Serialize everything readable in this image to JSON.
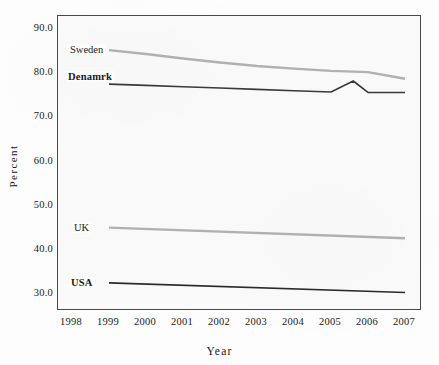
{
  "clipped_title": "",
  "chart_data": {
    "type": "line",
    "title": "",
    "xlabel": "Year",
    "ylabel": "Percent",
    "xlim": [
      1998,
      2007
    ],
    "ylim": [
      30.0,
      90.0
    ],
    "xticks": [
      "1998",
      "1999",
      "2000",
      "2001",
      "2002",
      "2003",
      "2004",
      "2005",
      "2006",
      "2007"
    ],
    "yticks": [
      "30.0",
      "40.0",
      "50.0",
      "60.0",
      "70.0",
      "80.0",
      "90.0"
    ],
    "grid": false,
    "legend": "inline-labels",
    "series": [
      {
        "name": "Sweden",
        "color": "#b0b0b0",
        "label_bold": false,
        "x": [
          1999,
          2000,
          2001,
          2002,
          2003,
          2004,
          2005,
          2006,
          2007
        ],
        "values": [
          85.0,
          84.1,
          83.1,
          82.2,
          81.4,
          80.8,
          80.3,
          80.0,
          78.5
        ]
      },
      {
        "name": "Denamrk",
        "color": "#3a3a3a",
        "label_bold": true,
        "x": [
          1999,
          2000,
          2001,
          2002,
          2003,
          2004,
          2005,
          2005.6,
          2006,
          2007
        ],
        "values": [
          77.3,
          77.0,
          76.7,
          76.4,
          76.1,
          75.8,
          75.5,
          78.0,
          75.4,
          75.4
        ]
      },
      {
        "name": "UK",
        "color": "#b0b0b0",
        "label_bold": false,
        "x": [
          1999,
          2007
        ],
        "values": [
          44.8,
          42.4
        ]
      },
      {
        "name": "USA",
        "color": "#2a2a2a",
        "label_bold": true,
        "x": [
          1999,
          2007
        ],
        "values": [
          32.3,
          30.1
        ]
      }
    ],
    "series_label_positions": [
      {
        "name": "Sweden",
        "left": 68,
        "top": 44
      },
      {
        "name": "Denamrk",
        "left": 66,
        "top": 71
      },
      {
        "name": "UK",
        "left": 72,
        "top": 222
      },
      {
        "name": "USA",
        "left": 69,
        "top": 277
      }
    ]
  }
}
